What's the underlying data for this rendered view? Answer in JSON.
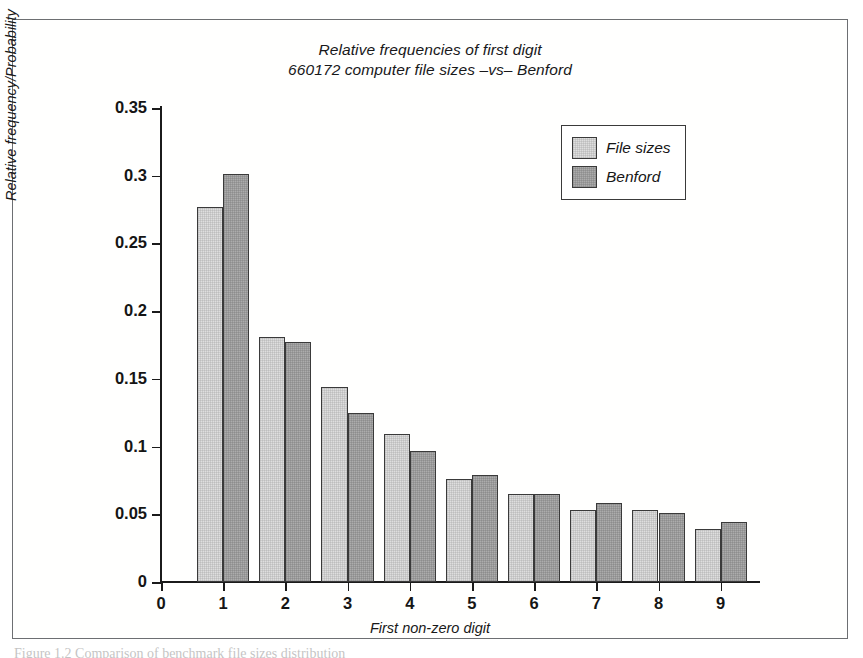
{
  "figure": {
    "caption": "Figure 1.2  Comparison of benchmark file sizes distribution"
  },
  "legend": {
    "position": "top-right",
    "items": [
      {
        "label": "File sizes",
        "color": "#dedede"
      },
      {
        "label": "Benford",
        "color": "#acacac"
      }
    ]
  },
  "chart_data": {
    "type": "bar",
    "title": "Relative frequencies of first digit",
    "subtitle": "660172 computer file sizes –vs– Benford",
    "xlabel": "First non-zero digit",
    "ylabel": "Relative frequency/Probability",
    "categories": [
      "1",
      "2",
      "3",
      "4",
      "5",
      "6",
      "7",
      "8",
      "9"
    ],
    "xticks": [
      "0",
      "1",
      "2",
      "3",
      "4",
      "5",
      "6",
      "7",
      "8",
      "9"
    ],
    "yticks": [
      "0",
      "0.05",
      "0.1",
      "0.15",
      "0.2",
      "0.25",
      "0.3",
      "0.35"
    ],
    "ytick_values": [
      0,
      0.05,
      0.1,
      0.15,
      0.2,
      0.25,
      0.3,
      0.35
    ],
    "ylim": [
      0,
      0.35
    ],
    "xlim": [
      0,
      9.6
    ],
    "grid": false,
    "series": [
      {
        "name": "File sizes",
        "color": "#dedede",
        "values": [
          0.277,
          0.181,
          0.144,
          0.109,
          0.076,
          0.065,
          0.053,
          0.053,
          0.039
        ]
      },
      {
        "name": "Benford",
        "color": "#acacac",
        "values": [
          0.301,
          0.177,
          0.125,
          0.097,
          0.079,
          0.065,
          0.058,
          0.051,
          0.044
        ]
      }
    ]
  }
}
